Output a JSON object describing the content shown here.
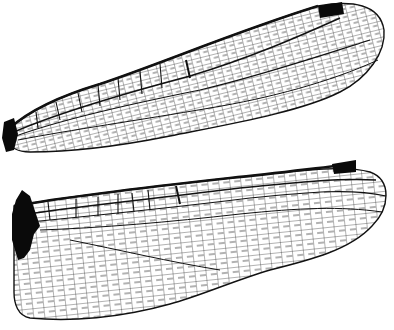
{
  "image": {
    "subject": "Dragonfly wing venation illustration",
    "wings": [
      {
        "id": "forewing",
        "label": "Forewing"
      },
      {
        "id": "hindwing",
        "label": "Hindwing"
      }
    ],
    "colors": {
      "background": "#ffffff",
      "vein": "#111111",
      "pterostigma": "#0a0a0a"
    }
  }
}
